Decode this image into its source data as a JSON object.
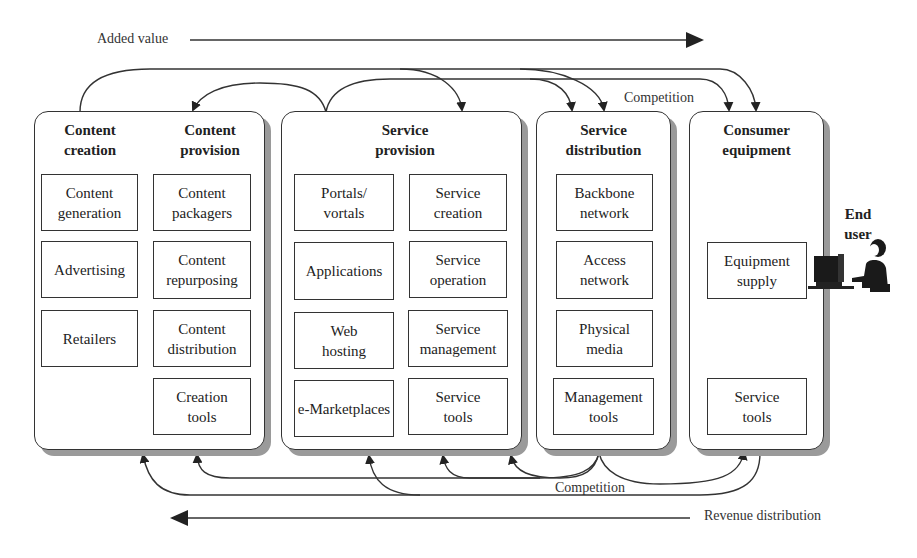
{
  "diagram": {
    "added_value_label": "Added value",
    "revenue_label": "Revenue distribution",
    "competition_top_label": "Competition",
    "competition_bottom_label": "Competition",
    "end_user_label_1": "End",
    "end_user_label_2": "user",
    "panels": [
      {
        "id": "content",
        "titles": [
          {
            "line1": "Content",
            "line2": "creation"
          },
          {
            "line1": "Content",
            "line2": "provision"
          }
        ],
        "boxes": [
          {
            "line1": "Content",
            "line2": "generation"
          },
          {
            "line1": "Advertising",
            "line2": ""
          },
          {
            "line1": "Retailers",
            "line2": ""
          },
          {
            "line1": "Content",
            "line2": "packagers"
          },
          {
            "line1": "Content",
            "line2": "repurposing"
          },
          {
            "line1": "Content",
            "line2": "distribution"
          },
          {
            "line1": "Creation",
            "line2": "tools"
          }
        ]
      },
      {
        "id": "service-provision",
        "titles": [
          {
            "line1": "Service",
            "line2": "provision"
          }
        ],
        "boxes": [
          {
            "line1": "Portals/",
            "line2": "vortals"
          },
          {
            "line1": "Applications",
            "line2": ""
          },
          {
            "line1": "Web",
            "line2": "hosting"
          },
          {
            "line1": "e-Marketplaces",
            "line2": ""
          },
          {
            "line1": "Service",
            "line2": "creation"
          },
          {
            "line1": "Service",
            "line2": "operation"
          },
          {
            "line1": "Service",
            "line2": "management"
          },
          {
            "line1": "Service",
            "line2": "tools"
          }
        ]
      },
      {
        "id": "service-distribution",
        "titles": [
          {
            "line1": "Service",
            "line2": "distribution"
          }
        ],
        "boxes": [
          {
            "line1": "Backbone",
            "line2": "network"
          },
          {
            "line1": "Access",
            "line2": "network"
          },
          {
            "line1": "Physical",
            "line2": "media"
          },
          {
            "line1": "Management",
            "line2": "tools"
          }
        ]
      },
      {
        "id": "consumer-equipment",
        "titles": [
          {
            "line1": "Consumer",
            "line2": "equipment"
          }
        ],
        "boxes": [
          {
            "line1": "Equipment",
            "line2": "supply"
          },
          {
            "line1": "Service",
            "line2": "tools"
          }
        ]
      }
    ]
  }
}
